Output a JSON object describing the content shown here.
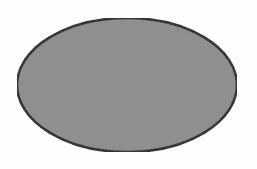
{
  "canvas": {
    "width": 257,
    "height": 169,
    "background": "#fdfdfd"
  },
  "shape": {
    "type": "ellipse",
    "cx": 127,
    "cy": 85,
    "rx": 110,
    "ry": 67,
    "fill": "#8c8c8c",
    "stroke": "#1c1c1c",
    "stroke_width": 2.5
  }
}
